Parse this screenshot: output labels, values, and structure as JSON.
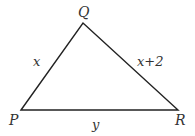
{
  "diagram": {
    "type": "triangle",
    "stroke_color": "#222222",
    "label_color": "#333333",
    "vertices": [
      {
        "id": "P",
        "label": "P",
        "x": 21,
        "y": 110
      },
      {
        "id": "Q",
        "label": "Q",
        "x": 83,
        "y": 23
      },
      {
        "id": "R",
        "label": "R",
        "x": 178,
        "y": 110
      }
    ],
    "sides": [
      {
        "id": "PQ",
        "from": "P",
        "to": "Q",
        "label": "x"
      },
      {
        "id": "QR",
        "from": "Q",
        "to": "R",
        "label": "x+2"
      },
      {
        "id": "PR",
        "from": "P",
        "to": "R",
        "label": "y"
      }
    ]
  }
}
